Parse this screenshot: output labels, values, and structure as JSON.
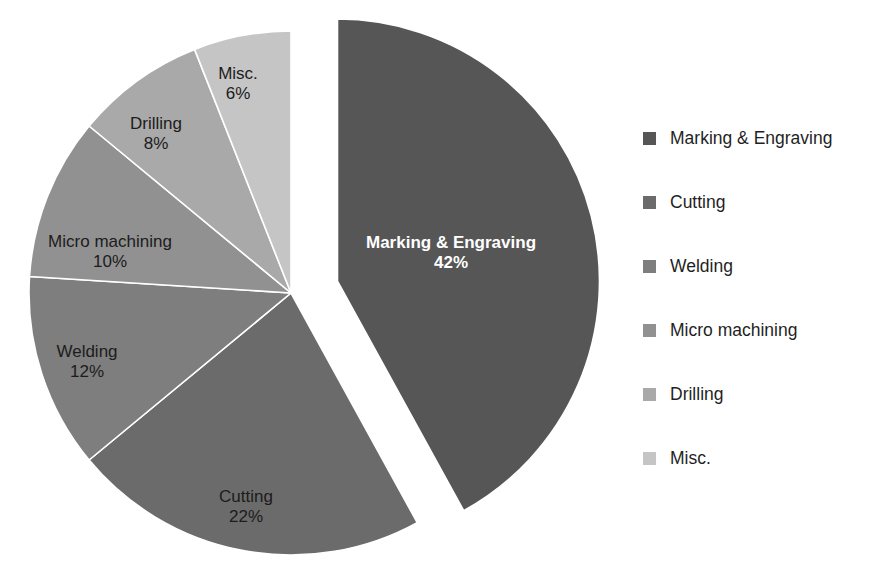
{
  "chart_data": {
    "type": "pie",
    "title": "",
    "subtitle": "",
    "xlabel": "",
    "ylabel": "",
    "legend_position": "right",
    "grid": false,
    "units": "percent",
    "total": 100,
    "exploded_slice": "Marking & Engraving",
    "categories": [
      "Marking & Engraving",
      "Cutting",
      "Welding",
      "Micro machining",
      "Drilling",
      "Misc."
    ],
    "values": [
      42,
      22,
      12,
      10,
      8,
      6
    ],
    "value_labels": [
      "42%",
      "22%",
      "12%",
      "10%",
      "8%",
      "6%"
    ],
    "colors": [
      "#565656",
      "#6b6b6b",
      "#7e7e7e",
      "#919191",
      "#a9a9a9",
      "#c5c5c5"
    ],
    "slices": [
      {
        "name": "Marking & Engraving",
        "value": 42,
        "value_label": "42%",
        "color": "#565656",
        "exploded": true,
        "label_on_dark": true,
        "label_x": 451,
        "label_y": 248,
        "pct_x": 451,
        "pct_y": 268
      },
      {
        "name": "Cutting",
        "value": 22,
        "value_label": "22%",
        "color": "#6b6b6b",
        "exploded": false,
        "label_on_dark": false,
        "label_x": 246,
        "label_y": 502,
        "pct_x": 246,
        "pct_y": 522
      },
      {
        "name": "Welding",
        "value": 12,
        "value_label": "12%",
        "color": "#7e7e7e",
        "exploded": false,
        "label_on_dark": false,
        "label_x": 87,
        "label_y": 357,
        "pct_x": 87,
        "pct_y": 377
      },
      {
        "name": "Micro machining",
        "value": 10,
        "value_label": "10%",
        "color": "#919191",
        "exploded": false,
        "label_on_dark": false,
        "label_x": 110,
        "label_y": 247,
        "pct_x": 110,
        "pct_y": 267
      },
      {
        "name": "Drilling",
        "value": 8,
        "value_label": "8%",
        "color": "#a9a9a9",
        "exploded": false,
        "label_on_dark": false,
        "label_x": 156,
        "label_y": 129,
        "pct_x": 156,
        "pct_y": 149
      },
      {
        "name": "Misc.",
        "value": 6,
        "value_label": "6%",
        "color": "#c5c5c5",
        "exploded": false,
        "label_on_dark": false,
        "label_x": 238,
        "label_y": 79,
        "pct_x": 238,
        "pct_y": 99
      }
    ],
    "geometry": {
      "center_x": 291,
      "center_y": 293,
      "radius": 262,
      "start_angle_deg": -90,
      "explode_offset": 48,
      "direction": "clockwise"
    }
  },
  "legend": {
    "items": [
      {
        "label": "Marking & Engraving",
        "color": "#565656"
      },
      {
        "label": "Cutting",
        "color": "#6b6b6b"
      },
      {
        "label": "Welding",
        "color": "#7e7e7e"
      },
      {
        "label": "Micro machining",
        "color": "#919191"
      },
      {
        "label": "Drilling",
        "color": "#a9a9a9"
      },
      {
        "label": "Misc.",
        "color": "#c5c5c5"
      }
    ]
  }
}
